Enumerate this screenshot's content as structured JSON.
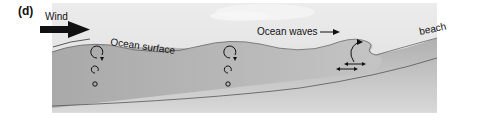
{
  "panel_label": "(d)",
  "labels": {
    "wind": "Wind",
    "ocean_surface": "Ocean surface",
    "ocean_waves": "Ocean waves",
    "beach": "beach"
  },
  "colors": {
    "sky": "#e6e6e6",
    "water": "#b5b5b5",
    "seafloor": "#a3a3a3",
    "line": "#555555",
    "arrow": "#111111"
  }
}
